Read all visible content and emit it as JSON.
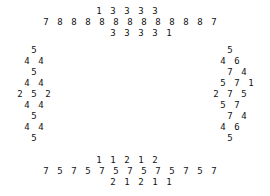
{
  "rows": [
    {
      "y": 6,
      "digits": [
        [
          "1",
          99
        ],
        [
          "3",
          113
        ],
        [
          "3",
          127
        ],
        [
          "3",
          141
        ],
        [
          "3",
          155
        ]
      ]
    },
    {
      "y": 17,
      "digits": [
        [
          "7",
          46
        ],
        [
          "8",
          60
        ],
        [
          "8",
          74
        ],
        [
          "8",
          88
        ],
        [
          "8",
          102
        ],
        [
          "8",
          116
        ],
        [
          "8",
          130
        ],
        [
          "8",
          144
        ],
        [
          "8",
          158
        ],
        [
          "8",
          172
        ],
        [
          "8",
          186
        ],
        [
          "8",
          200
        ],
        [
          "7",
          214
        ]
      ]
    },
    {
      "y": 28,
      "digits": [
        [
          "3",
          113
        ],
        [
          "3",
          127
        ],
        [
          "3",
          141
        ],
        [
          "3",
          155
        ],
        [
          "1",
          169
        ]
      ]
    },
    {
      "y": 45,
      "digits": [
        [
          "5",
          34
        ],
        [
          "5",
          230
        ]
      ]
    },
    {
      "y": 56,
      "digits": [
        [
          "4",
          27
        ],
        [
          "4",
          41
        ],
        [
          "4",
          223
        ],
        [
          "6",
          237
        ]
      ]
    },
    {
      "y": 67,
      "digits": [
        [
          "5",
          34
        ],
        [
          "7",
          230
        ],
        [
          "4",
          244
        ]
      ]
    },
    {
      "y": 78,
      "digits": [
        [
          "4",
          27
        ],
        [
          "4",
          41
        ],
        [
          "5",
          223
        ],
        [
          "7",
          237
        ],
        [
          "1",
          251
        ]
      ]
    },
    {
      "y": 89,
      "digits": [
        [
          "2",
          20
        ],
        [
          "5",
          34
        ],
        [
          "2",
          48
        ],
        [
          "2",
          216
        ],
        [
          "7",
          230
        ],
        [
          "5",
          244
        ]
      ]
    },
    {
      "y": 100,
      "digits": [
        [
          "4",
          27
        ],
        [
          "4",
          41
        ],
        [
          "5",
          223
        ],
        [
          "7",
          237
        ]
      ]
    },
    {
      "y": 111,
      "digits": [
        [
          "5",
          34
        ],
        [
          "7",
          230
        ],
        [
          "4",
          244
        ]
      ]
    },
    {
      "y": 122,
      "digits": [
        [
          "4",
          27
        ],
        [
          "4",
          41
        ],
        [
          "4",
          223
        ],
        [
          "6",
          237
        ]
      ]
    },
    {
      "y": 133,
      "digits": [
        [
          "5",
          34
        ],
        [
          "5",
          230
        ]
      ]
    },
    {
      "y": 155,
      "digits": [
        [
          "1",
          99
        ],
        [
          "1",
          113
        ],
        [
          "2",
          127
        ],
        [
          "1",
          141
        ],
        [
          "2",
          155
        ]
      ]
    },
    {
      "y": 166,
      "digits": [
        [
          "7",
          46
        ],
        [
          "5",
          60
        ],
        [
          "7",
          74
        ],
        [
          "5",
          88
        ],
        [
          "7",
          102
        ],
        [
          "5",
          116
        ],
        [
          "7",
          130
        ],
        [
          "5",
          144
        ],
        [
          "7",
          158
        ],
        [
          "5",
          172
        ],
        [
          "7",
          186
        ],
        [
          "5",
          200
        ],
        [
          "7",
          214
        ]
      ]
    },
    {
      "y": 177,
      "digits": [
        [
          "2",
          113
        ],
        [
          "1",
          127
        ],
        [
          "2",
          141
        ],
        [
          "1",
          155
        ],
        [
          "1",
          169
        ]
      ]
    }
  ]
}
